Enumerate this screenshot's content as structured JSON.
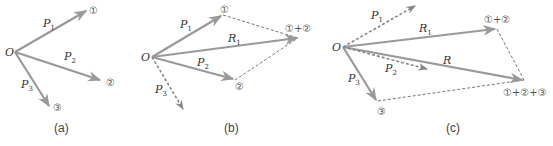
{
  "colors": {
    "vector": "#999999",
    "dashed": "#777777",
    "text": "#333333"
  },
  "panels": [
    {
      "caption": "(a)",
      "origin_label": "O",
      "vectors": [
        {
          "name": "P",
          "sub": "1",
          "end_label": "①"
        },
        {
          "name": "P",
          "sub": "2",
          "end_label": "②"
        },
        {
          "name": "P",
          "sub": "3",
          "end_label": "③"
        }
      ]
    },
    {
      "caption": "(b)",
      "origin_label": "O",
      "vectors": [
        {
          "name": "P",
          "sub": "1",
          "end_label": "①"
        },
        {
          "name": "R",
          "sub": "1",
          "end_label": "①+②"
        },
        {
          "name": "P",
          "sub": "2",
          "end_label": "②"
        },
        {
          "name": "P",
          "sub": "3",
          "end_label": ""
        }
      ]
    },
    {
      "caption": "(c)",
      "origin_label": "O",
      "vectors": [
        {
          "name": "P",
          "sub": "1",
          "end_label": ""
        },
        {
          "name": "R",
          "sub": "1",
          "end_label": "①+②"
        },
        {
          "name": "R",
          "sub": "",
          "end_label": "①+②+③"
        },
        {
          "name": "P",
          "sub": "2",
          "end_label": ""
        },
        {
          "name": "P",
          "sub": "3",
          "end_label": "③"
        }
      ]
    }
  ]
}
